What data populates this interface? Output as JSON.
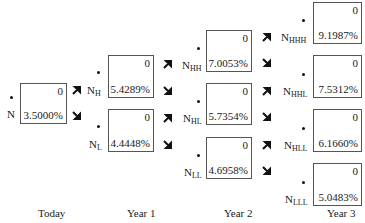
{
  "diagram": {
    "type": "binomial-interest-rate-tree",
    "nodes": [
      {
        "id": "N",
        "name": "N",
        "sub": "",
        "value": "0",
        "rate": "3.5000%",
        "x": 20,
        "y": 83,
        "w": 47,
        "h": 41
      },
      {
        "id": "NH",
        "name": "N",
        "sub": "H",
        "value": "0",
        "rate": "5.4289%",
        "x": 108,
        "y": 55,
        "w": 46,
        "h": 43
      },
      {
        "id": "NL",
        "name": "N",
        "sub": "L",
        "value": "0",
        "rate": "4.4448%",
        "x": 108,
        "y": 109,
        "w": 46,
        "h": 43
      },
      {
        "id": "NHH",
        "name": "N",
        "sub": "HH",
        "value": "0",
        "rate": "7.0053%",
        "x": 206,
        "y": 30,
        "w": 46,
        "h": 42
      },
      {
        "id": "NHL",
        "name": "N",
        "sub": "HL",
        "value": "0",
        "rate": "5.7354%",
        "x": 206,
        "y": 83,
        "w": 46,
        "h": 42
      },
      {
        "id": "NLL",
        "name": "N",
        "sub": "LL",
        "value": "0",
        "rate": "4.6958%",
        "x": 206,
        "y": 137,
        "w": 46,
        "h": 42
      },
      {
        "id": "NHHH",
        "name": "N",
        "sub": "HHH",
        "value": "0",
        "rate": "9.1987%",
        "x": 313,
        "y": 2,
        "w": 49,
        "h": 42
      },
      {
        "id": "NHHL",
        "name": "N",
        "sub": "HHL",
        "value": "0",
        "rate": "7.5312%",
        "x": 313,
        "y": 55,
        "w": 49,
        "h": 43
      },
      {
        "id": "NHLL",
        "name": "N",
        "sub": "HLL",
        "value": "0",
        "rate": "6.1660%",
        "x": 313,
        "y": 109,
        "w": 49,
        "h": 43
      },
      {
        "id": "NLLL",
        "name": "N",
        "sub": "LLL",
        "value": "0",
        "rate": "5.0483%",
        "x": 313,
        "y": 163,
        "w": 49,
        "h": 43
      }
    ],
    "periods": [
      "Today",
      "Year 1",
      "Year 2",
      "Year 3"
    ]
  }
}
